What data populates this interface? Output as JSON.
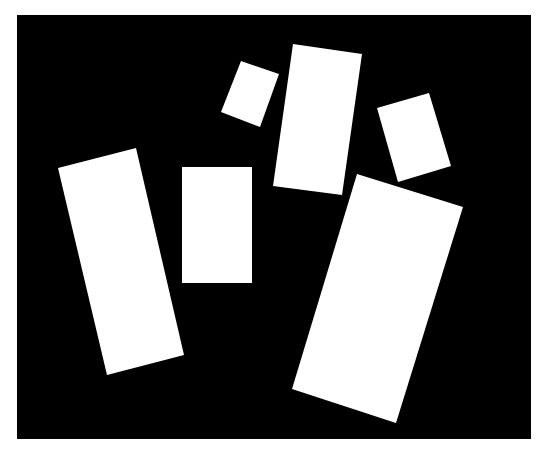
{
  "canvas": {
    "width": 540,
    "height": 451,
    "background": "#ffffff"
  },
  "frame": {
    "x": 17,
    "y": 15,
    "width": 514,
    "height": 424,
    "fill": "#000000"
  },
  "shape_fill": "#ffffff",
  "shapes": [
    {
      "id": "rect-left-tall",
      "points": "58,168 136,148 184,355 107,375"
    },
    {
      "id": "rect-center-upright",
      "points": "182,167 252,167 252,283 182,283"
    },
    {
      "id": "rect-small-top",
      "points": "241,61 279,74 260,127 221,112"
    },
    {
      "id": "rect-top-center-tall",
      "points": "293,44 362,54 342,195 273,186"
    },
    {
      "id": "rect-right-small",
      "points": "377,108 429,93 451,166 398,182"
    },
    {
      "id": "rect-bottom-right-large",
      "points": "357,174 463,207 396,423 292,389"
    }
  ]
}
